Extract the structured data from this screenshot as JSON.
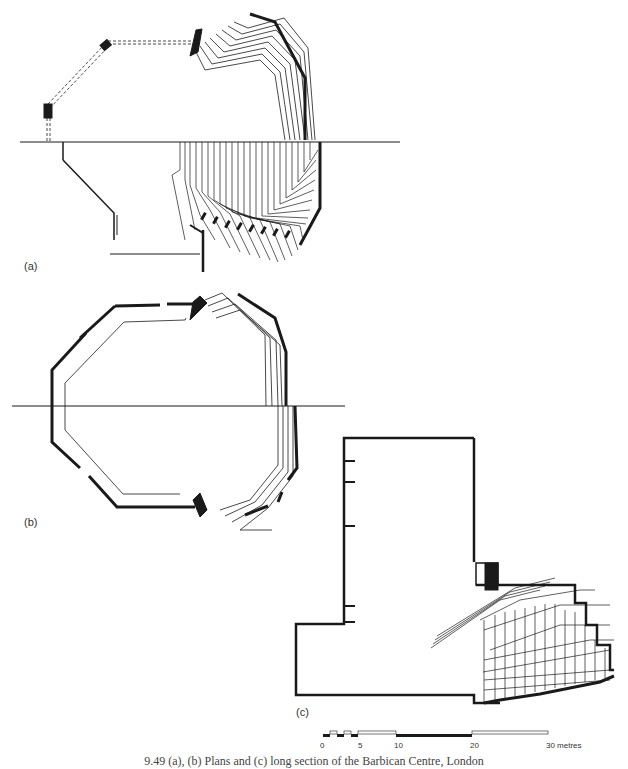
{
  "figure": {
    "panels": [
      {
        "id": "a",
        "label": "(a)",
        "description": "Plan at upper and lower levels showing stepped balcony seating"
      },
      {
        "id": "b",
        "label": "(b)",
        "description": "Plan of octagonal auditorium with tiered balconies"
      },
      {
        "id": "c",
        "label": "(c)",
        "description": "Long section showing stage house and stacked balconies"
      }
    ],
    "scale_bar": {
      "ticks": [
        "0",
        "5",
        "10",
        "20",
        "30 metres"
      ],
      "unit": "metres"
    },
    "caption": "9.49 (a), (b) Plans and (c) long section of the Barbican Centre, London"
  },
  "colors": {
    "ink": "#1a1a1a",
    "background": "#ffffff"
  }
}
